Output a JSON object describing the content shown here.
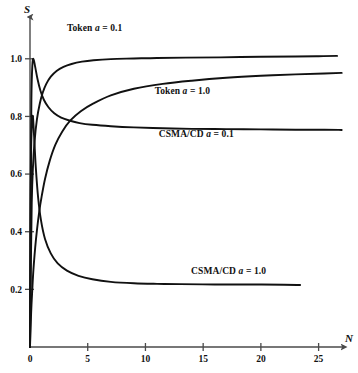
{
  "chart_data": {
    "type": "line",
    "title": "",
    "subtitle": "",
    "xlabel": "N",
    "ylabel": "S",
    "xlim": [
      0,
      27.2
    ],
    "ylim": [
      0,
      1.145
    ],
    "grid": false,
    "legend": "inline-annotations",
    "x_ticks": [
      0,
      5,
      10,
      15,
      20,
      25
    ],
    "x_tick_labels": [
      "0",
      "5",
      "10",
      "15",
      "20",
      "25"
    ],
    "y_ticks": [
      0.2,
      0.4,
      0.6,
      0.8,
      1.0
    ],
    "y_tick_labels": [
      "0.2",
      "0.4",
      "0.6",
      "0.8",
      "1.0"
    ],
    "series": [
      {
        "name": "Token a = 0.1",
        "label_parts": {
          "prefix": "Token ",
          "italic": "a",
          "suffix": " = 0.1"
        },
        "label_x": 5.6,
        "label_y": 1.095,
        "asymptote": 1.01,
        "x": [
          0.0,
          0.08,
          0.15,
          0.25,
          0.4,
          0.6,
          0.85,
          1.1,
          1.4,
          1.8,
          2.3,
          2.9,
          3.6,
          4.5,
          5.5,
          7.0,
          9.0,
          11.0,
          13.5,
          16.5,
          20.0,
          23.0,
          25.0,
          26.6
        ],
        "y": [
          0.0,
          0.3,
          0.5,
          0.62,
          0.715,
          0.79,
          0.845,
          0.882,
          0.912,
          0.938,
          0.958,
          0.972,
          0.982,
          0.99,
          0.995,
          0.999,
          1.001,
          1.003,
          1.004,
          1.005,
          1.007,
          1.008,
          1.009,
          1.01
        ]
      },
      {
        "name": "Token a = 1.0",
        "label_parts": {
          "prefix": "Token ",
          "italic": "a",
          "suffix": " = 1.0"
        },
        "label_x": 13.2,
        "label_y": 0.878,
        "asymptote": 0.95,
        "x": [
          0.0,
          0.1,
          0.2,
          0.3,
          0.45,
          0.6,
          0.8,
          1.0,
          1.3,
          1.7,
          2.2,
          2.8,
          3.5,
          4.4,
          5.5,
          7.0,
          9.0,
          11.5,
          14.0,
          17.0,
          20.0,
          23.0,
          25.5,
          27.0
        ],
        "y": [
          0.0,
          0.12,
          0.2,
          0.27,
          0.345,
          0.405,
          0.47,
          0.52,
          0.583,
          0.645,
          0.702,
          0.748,
          0.786,
          0.818,
          0.845,
          0.873,
          0.896,
          0.913,
          0.924,
          0.934,
          0.941,
          0.946,
          0.949,
          0.951
        ]
      },
      {
        "name": "CSMA/CD a = 0.1",
        "label_parts": {
          "prefix": "CSMA/CD ",
          "italic": "a",
          "suffix": " = 0.1"
        },
        "label_x": 14.4,
        "label_y": 0.727,
        "asymptote": 0.755,
        "peak_x": 0.3,
        "peak_y": 1.0,
        "x": [
          0.0,
          0.06,
          0.12,
          0.2,
          0.3,
          0.45,
          0.65,
          0.9,
          1.2,
          1.6,
          2.1,
          2.7,
          3.4,
          4.3,
          5.4,
          7.0,
          9.0,
          11.5,
          14.0,
          17.0,
          20.0,
          23.0,
          25.5,
          27.0
        ],
        "y": [
          0.0,
          0.55,
          0.86,
          0.975,
          1.0,
          0.972,
          0.93,
          0.89,
          0.858,
          0.832,
          0.811,
          0.796,
          0.786,
          0.777,
          0.771,
          0.766,
          0.762,
          0.759,
          0.757,
          0.756,
          0.755,
          0.754,
          0.754,
          0.753
        ]
      },
      {
        "name": "CSMA/CD a = 1.0",
        "label_parts": {
          "prefix": "CSMA/CD ",
          "italic": "a",
          "suffix": " = 1.0"
        },
        "label_x": 17.2,
        "label_y": 0.255,
        "asymptote": 0.215,
        "peak_x": 0.25,
        "peak_y": 0.8,
        "x": [
          0.0,
          0.05,
          0.1,
          0.17,
          0.25,
          0.35,
          0.5,
          0.7,
          0.95,
          1.3,
          1.8,
          2.4,
          3.2,
          4.2,
          5.4,
          7.0,
          9.0,
          11.0,
          13.0,
          16.0,
          19.0,
          22.0,
          23.4
        ],
        "y": [
          0.0,
          0.46,
          0.69,
          0.78,
          0.8,
          0.735,
          0.625,
          0.52,
          0.44,
          0.375,
          0.325,
          0.29,
          0.265,
          0.247,
          0.235,
          0.226,
          0.221,
          0.219,
          0.218,
          0.217,
          0.217,
          0.216,
          0.215
        ]
      }
    ]
  },
  "axes": {
    "y_title": "S",
    "x_title": "N"
  }
}
